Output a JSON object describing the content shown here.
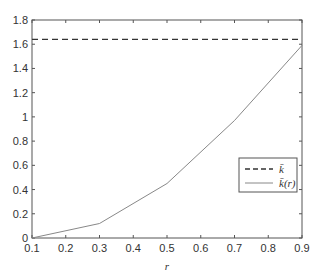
{
  "chart_data": {
    "type": "line",
    "title": "",
    "xlabel": "r",
    "ylabel": "",
    "xlim": [
      0.1,
      0.9
    ],
    "ylim": [
      0,
      1.8
    ],
    "xticks": [
      0.1,
      0.2,
      0.3,
      0.4,
      0.5,
      0.6,
      0.7,
      0.8,
      0.9
    ],
    "xtick_labels": [
      "0.1",
      "0.2",
      "0.3",
      "0.4",
      "0.5",
      "0.6",
      "0.7",
      "0.8",
      "0.9"
    ],
    "yticks": [
      0,
      0.2,
      0.4,
      0.6,
      0.8,
      1,
      1.2,
      1.4,
      1.6,
      1.8
    ],
    "ytick_labels": [
      "0",
      "0.2",
      "0.4",
      "0.6",
      "0.8",
      "1",
      "1.2",
      "1.4",
      "1.6",
      "1.8"
    ],
    "grid": false,
    "legend_position": "right, lower-middle",
    "series": [
      {
        "name": "k̄",
        "style": "dashed",
        "color": "#333333",
        "x": [
          0.1,
          0.9
        ],
        "values": [
          1.64,
          1.64
        ]
      },
      {
        "name": "k̄(r)",
        "style": "solid",
        "color": "#888888",
        "x": [
          0.1,
          0.3,
          0.5,
          0.7,
          0.9
        ],
        "values": [
          0.0,
          0.12,
          0.45,
          0.97,
          1.59
        ]
      }
    ]
  },
  "legend": {
    "entries": [
      {
        "label": "k̄"
      },
      {
        "label": "k̄(r)"
      }
    ]
  }
}
